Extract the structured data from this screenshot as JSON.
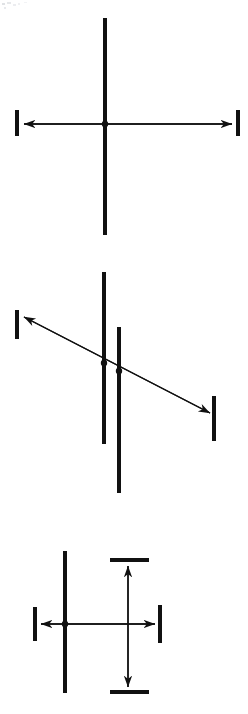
{
  "document": {
    "title": "Kinematic constraint diagrams",
    "background_color": "#ffffff",
    "ink_color": "#111111",
    "width": 248,
    "height": 714
  },
  "figure": {
    "type": "line-diagram",
    "panels": [
      {
        "id": "panel-1",
        "label": "top-panel",
        "caption": "",
        "elements": {
          "vertical_bars": [
            {
              "name": "bar-center",
              "x": 105,
              "y1": 18,
              "y2": 235,
              "thickness": 4
            }
          ],
          "arrows": [
            {
              "name": "horizontal-arrow",
              "orientation": "horizontal",
              "x1": 24,
              "y1": 124,
              "x2": 232,
              "y2": 124,
              "double_headed": true,
              "thickness": 1.4
            }
          ],
          "end_bars": [
            {
              "name": "left-end-bar",
              "x": 17,
              "y1": 110,
              "y2": 136,
              "thickness": 4
            },
            {
              "name": "right-end-bar",
              "x": 238,
              "y1": 110,
              "y2": 136,
              "thickness": 4
            }
          ],
          "joints": [
            {
              "name": "pivot-dot",
              "cx": 105,
              "cy": 124,
              "r": 3.2
            }
          ]
        }
      },
      {
        "id": "panel-2",
        "label": "middle-panel",
        "caption": "",
        "elements": {
          "vertical_bars": [
            {
              "name": "bar-left",
              "x": 104,
              "y1": 272,
              "y2": 444,
              "thickness": 4
            },
            {
              "name": "bar-right",
              "x": 119,
              "y1": 327,
              "y2": 493,
              "thickness": 4
            }
          ],
          "arrows": [
            {
              "name": "diagonal-arrow",
              "orientation": "diagonal",
              "x1": 24,
              "y1": 317,
              "x2": 210,
              "y2": 413,
              "double_headed": true,
              "thickness": 1.4
            }
          ],
          "end_bars": [
            {
              "name": "left-end-bar",
              "x": 17,
              "y1": 310,
              "y2": 339,
              "thickness": 4
            },
            {
              "name": "right-end-bar",
              "x": 214,
              "y1": 396,
              "y2": 441,
              "thickness": 4
            }
          ],
          "joints": [
            {
              "name": "pivot-dot-left",
              "cx": 104,
              "cy": 363,
              "r": 3.2
            },
            {
              "name": "pivot-dot-right",
              "cx": 119,
              "cy": 371,
              "r": 3.2
            }
          ]
        }
      },
      {
        "id": "panel-3",
        "label": "bottom-panel",
        "caption": "",
        "elements": {
          "vertical_bars": [
            {
              "name": "bar-left",
              "x": 65,
              "y1": 551,
              "y2": 693,
              "thickness": 4
            }
          ],
          "arrows": [
            {
              "name": "horizontal-arrow",
              "orientation": "horizontal",
              "x1": 41,
              "y1": 624,
              "x2": 155,
              "y2": 624,
              "double_headed": true,
              "thickness": 1.4
            },
            {
              "name": "vertical-arrow",
              "orientation": "vertical",
              "x1": 128,
              "y1": 566,
              "x2": 128,
              "y2": 687,
              "double_headed": true,
              "thickness": 1.4
            }
          ],
          "end_bars": [
            {
              "name": "left-end-bar",
              "x": 35,
              "y1": 607,
              "y2": 641,
              "thickness": 4
            },
            {
              "name": "right-end-bar",
              "x": 160,
              "y1": 605,
              "y2": 643,
              "thickness": 4
            },
            {
              "name": "top-end-bar",
              "y": 560,
              "x1": 110,
              "x2": 149,
              "thickness": 4
            },
            {
              "name": "bottom-end-bar",
              "y": 692,
              "x1": 110,
              "x2": 149,
              "thickness": 4
            }
          ],
          "joints": [
            {
              "name": "pivot-dot",
              "cx": 65,
              "cy": 624,
              "r": 3.2
            }
          ]
        }
      }
    ]
  }
}
